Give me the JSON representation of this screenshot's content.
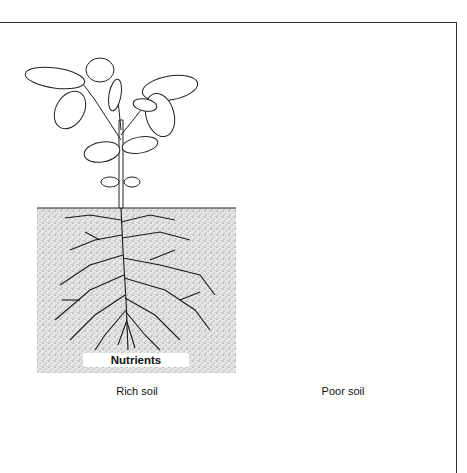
{
  "figure": {
    "panels": [
      {
        "id": "rich",
        "caption": "Rich soil",
        "soil_texture": "coarse-stipple",
        "plant_size": "large",
        "root_density": "dense"
      },
      {
        "id": "poor",
        "caption": "Poor soil",
        "soil_texture": "fine-halftone",
        "plant_size": "small",
        "root_density": "sparse"
      }
    ],
    "nutrients_label": "Nutrients"
  },
  "colors": {
    "line": "#222222",
    "rich_soil_bg": "#e2e2e2",
    "poor_soil_bg": "#d6d6d6",
    "frame": "#333333"
  }
}
